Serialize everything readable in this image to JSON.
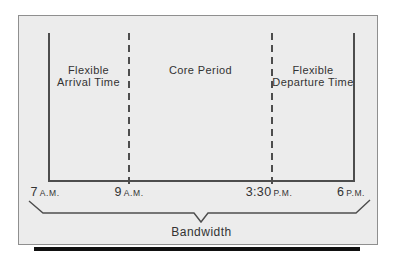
{
  "figure": {
    "sections": [
      {
        "line1": "Flexible",
        "line2": "Arrival Time"
      },
      {
        "line1": "Core Period",
        "line2": ""
      },
      {
        "line1": "Flexible",
        "line2": "Departure Time"
      }
    ],
    "ticks": [
      {
        "time": "7",
        "period": "A.M."
      },
      {
        "time": "9",
        "period": "A.M."
      },
      {
        "time": "3:30",
        "period": "P.M."
      },
      {
        "time": "6",
        "period": "P.M."
      }
    ],
    "brace_label": "Bandwidth"
  },
  "colors": {
    "panel_bg": "#ececec",
    "panel_border": "#8f8f8f",
    "line": "#4d4d4d",
    "text": "#333333",
    "shadow": "#111111"
  }
}
